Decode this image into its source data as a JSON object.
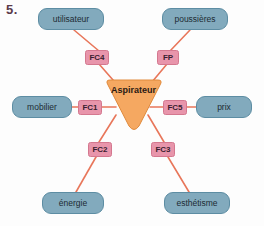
{
  "exercise": {
    "number": "5."
  },
  "diagram": {
    "type": "octopus-diagram",
    "center": {
      "label": "Aspirateur",
      "shape": "inverted-triangle",
      "color": "#f5a861"
    },
    "colors": {
      "node_fill": "#82aabd",
      "node_stroke": "#5d8da3",
      "fc_fill": "#e895ab",
      "fc_stroke": "#d4788f",
      "center_fill": "#f5a861",
      "center_stroke": "#e08a3c",
      "wire": "#e8765a",
      "number_text": "#5b3a4a"
    },
    "nodes": [
      {
        "id": "utilisateur",
        "label": "utilisateur",
        "x": 38,
        "y": 8,
        "w": 66,
        "h": 22
      },
      {
        "id": "poussieres",
        "label": "poussières",
        "x": 162,
        "y": 8,
        "w": 66,
        "h": 22
      },
      {
        "id": "mobilier",
        "label": "mobilier",
        "x": 12,
        "y": 96,
        "w": 60,
        "h": 22
      },
      {
        "id": "prix",
        "label": "prix",
        "x": 196,
        "y": 96,
        "w": 56,
        "h": 22
      },
      {
        "id": "energie",
        "label": "énergie",
        "x": 42,
        "y": 192,
        "w": 62,
        "h": 22
      },
      {
        "id": "esthetisme",
        "label": "esthétisme",
        "x": 164,
        "y": 192,
        "w": 66,
        "h": 22
      }
    ],
    "functions": [
      {
        "id": "FC4",
        "label": "FC4",
        "x": 85,
        "y": 50,
        "w": 24,
        "h": 15,
        "connects": "utilisateur"
      },
      {
        "id": "FP",
        "label": "FP",
        "x": 157,
        "y": 50,
        "w": 22,
        "h": 15,
        "connects": "poussières"
      },
      {
        "id": "FC1",
        "label": "FC1",
        "x": 78,
        "y": 100,
        "w": 24,
        "h": 15,
        "connects": "mobilier"
      },
      {
        "id": "FC5",
        "label": "FC5",
        "x": 163,
        "y": 100,
        "w": 24,
        "h": 15,
        "connects": "prix"
      },
      {
        "id": "FC2",
        "label": "FC2",
        "x": 88,
        "y": 142,
        "w": 24,
        "h": 15,
        "connects": "énergie"
      },
      {
        "id": "FC3",
        "label": "FC3",
        "x": 151,
        "y": 142,
        "w": 24,
        "h": 15,
        "connects": "esthétisme"
      }
    ]
  }
}
